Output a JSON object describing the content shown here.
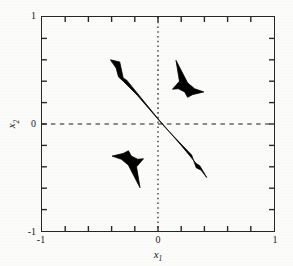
{
  "figure": {
    "background_color": "#fbfbfa",
    "frame_color": "#262626",
    "data_color": "#000000"
  },
  "axis": {
    "xlabel_main": "x",
    "xlabel_sub": "1",
    "ylabel_main": "x",
    "ylabel_sub": "2"
  },
  "ticks": {
    "x_labels": [
      "-1",
      "0",
      "1"
    ],
    "y_labels": [
      "-1",
      "0",
      "1"
    ]
  },
  "chart_data": {
    "type": "scatter",
    "title": "",
    "xlabel": "x1",
    "ylabel": "x2",
    "xlim": [
      -1,
      1
    ],
    "ylim": [
      -1,
      1
    ],
    "xticks": [
      -1,
      0,
      1
    ],
    "yticks": [
      -1,
      0,
      1
    ],
    "minor_tick_step": 0.2,
    "grid": false,
    "legend": "none",
    "reference_lines": [
      {
        "name": "vertical-zero-line",
        "orientation": "vertical",
        "value": 0,
        "style": "dotted"
      },
      {
        "name": "horizontal-zero-line",
        "orientation": "horizontal",
        "value": 0,
        "style": "dashed"
      }
    ],
    "regions": [
      {
        "name": "diagonal-band",
        "description": "elongated black band from upper-left to lower-right through origin",
        "fill": "#000000",
        "extent_x": [
          -0.41,
          0.42
        ],
        "extent_y": [
          -0.5,
          0.6
        ],
        "polygon": [
          [
            -0.41,
            0.6
          ],
          [
            -0.33,
            0.58
          ],
          [
            -0.3,
            0.43
          ],
          [
            -0.27,
            0.41
          ],
          [
            0.0,
            0.05
          ],
          [
            0.2,
            -0.2
          ],
          [
            0.33,
            -0.37
          ],
          [
            0.36,
            -0.39
          ],
          [
            0.42,
            -0.5
          ],
          [
            0.37,
            -0.43
          ],
          [
            0.33,
            -0.41
          ],
          [
            0.29,
            -0.29
          ],
          [
            0.06,
            -0.03
          ],
          [
            -0.18,
            0.27
          ],
          [
            -0.3,
            0.4
          ],
          [
            -0.34,
            0.44
          ],
          [
            -0.36,
            0.52
          ]
        ]
      },
      {
        "name": "upper-right-region",
        "description": "concave three-pointed black region in upper-right quadrant",
        "fill": "#000000",
        "extent_x": [
          0.12,
          0.4
        ],
        "extent_y": [
          0.25,
          0.6
        ],
        "polygon": [
          [
            0.155,
            0.595
          ],
          [
            0.255,
            0.385
          ],
          [
            0.315,
            0.33
          ],
          [
            0.395,
            0.3
          ],
          [
            0.3,
            0.275
          ],
          [
            0.255,
            0.25
          ],
          [
            0.23,
            0.3
          ],
          [
            0.175,
            0.33
          ],
          [
            0.125,
            0.325
          ],
          [
            0.185,
            0.4
          ]
        ]
      },
      {
        "name": "lower-left-region",
        "description": "concave three-pointed black region in lower-left quadrant (180-degree rotation of upper-right region)",
        "fill": "#000000",
        "extent_x": [
          -0.4,
          -0.12
        ],
        "extent_y": [
          -0.6,
          -0.25
        ],
        "polygon": [
          [
            -0.155,
            -0.595
          ],
          [
            -0.255,
            -0.385
          ],
          [
            -0.315,
            -0.33
          ],
          [
            -0.395,
            -0.3
          ],
          [
            -0.3,
            -0.275
          ],
          [
            -0.255,
            -0.25
          ],
          [
            -0.23,
            -0.3
          ],
          [
            -0.175,
            -0.33
          ],
          [
            -0.125,
            -0.325
          ],
          [
            -0.185,
            -0.4
          ]
        ]
      }
    ]
  }
}
